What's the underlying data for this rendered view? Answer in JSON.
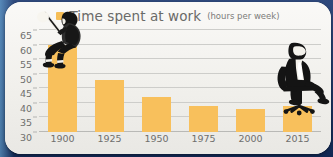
{
  "card": {
    "background_color": "#f3f2ef",
    "accent_color": "#f8c05c",
    "text_color": "#6f6f6d",
    "outer_color": "#17356e"
  },
  "header": {
    "legend_swatch_name": "legend-color-swatch",
    "title": "Time spent at work",
    "subtitle": "(hours per week)"
  },
  "illustrations": [
    {
      "name": "worker-with-pickaxe-silhouette",
      "label": "Man sitting on 1900 bar holding a pickaxe"
    },
    {
      "name": "businessman-on-office-chair-silhouette",
      "label": "Businessman sitting on office chair on 2015 bar"
    }
  ],
  "chart_data": {
    "type": "bar",
    "title": "Time spent at work",
    "subtitle": "(hours per week)",
    "xlabel": "",
    "ylabel": "",
    "categories": [
      "1900",
      "1925",
      "1950",
      "1975",
      "2000",
      "2015"
    ],
    "values": [
      60,
      48,
      42,
      39,
      38,
      39
    ],
    "series": [
      {
        "name": "Time spent at work",
        "values": [
          60,
          48,
          42,
          39,
          38,
          39
        ],
        "color": "#f8c05c"
      }
    ],
    "ylim": [
      30,
      65
    ],
    "yticks": [
      30,
      35,
      40,
      45,
      50,
      55,
      60,
      65
    ],
    "ytick_labels": [
      "30",
      "35",
      "40",
      "45",
      "50",
      "55",
      "60",
      "65"
    ],
    "grid": true,
    "legend_position": "top-center",
    "legend_entries": [
      "Time spent at work"
    ],
    "units": "hours per week"
  }
}
